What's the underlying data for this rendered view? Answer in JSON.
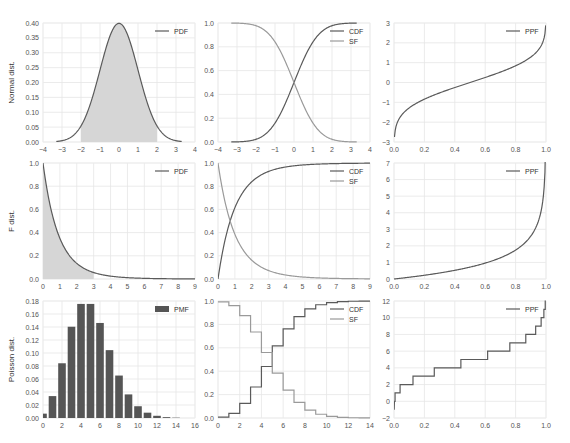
{
  "figure": {
    "row_labels": [
      "Normal dist.",
      "F dist.",
      "Poisson dist."
    ],
    "colors": {
      "dark_line": "#5a5a5a",
      "light_line": "#9a9a9a",
      "fill": "#d6d6d6",
      "bar": "#555555",
      "grid": "#e6e6e6"
    }
  },
  "chart_data": [
    {
      "id": "normal-pdf",
      "type": "area",
      "title": "",
      "ylabel": "Normal dist.",
      "xlim": [
        -4,
        4
      ],
      "ylim": [
        0,
        0.4
      ],
      "xticks": [
        "−4",
        "−3",
        "−2",
        "−1",
        "0",
        "1",
        "2",
        "3",
        "4"
      ],
      "yticks": [
        "0.00",
        "0.05",
        "0.10",
        "0.15",
        "0.20",
        "0.25",
        "0.30",
        "0.35",
        "0.40"
      ],
      "legend": [
        "PDF"
      ],
      "series": [
        {
          "name": "PDF",
          "function": "normal_pdf",
          "x_range": [
            -3.3,
            3.3
          ]
        }
      ],
      "shaded_region": [
        -2,
        2
      ],
      "grid": true,
      "legend_position": "upper right"
    },
    {
      "id": "normal-cdf-sf",
      "type": "line",
      "xlim": [
        -4,
        4
      ],
      "ylim": [
        0,
        1
      ],
      "xticks": [
        "−4",
        "−3",
        "−2",
        "−1",
        "0",
        "1",
        "2",
        "3",
        "4"
      ],
      "yticks": [
        "0.0",
        "0.2",
        "0.4",
        "0.6",
        "0.8",
        "1.0"
      ],
      "legend": [
        "CDF",
        "SF"
      ],
      "series": [
        {
          "name": "CDF",
          "function": "normal_cdf",
          "x_range": [
            -3.3,
            3.3
          ]
        },
        {
          "name": "SF",
          "function": "normal_sf",
          "x_range": [
            -3.3,
            3.3
          ]
        }
      ],
      "grid": true,
      "legend_position": "upper right"
    },
    {
      "id": "normal-ppf",
      "type": "line",
      "xlim": [
        0,
        1
      ],
      "ylim": [
        -3,
        3
      ],
      "xticks": [
        "0.0",
        "0.2",
        "0.4",
        "0.6",
        "0.8",
        "1.0"
      ],
      "yticks": [
        "−3",
        "−2",
        "−1",
        "0",
        "1",
        "2",
        "3"
      ],
      "legend": [
        "PPF"
      ],
      "series": [
        {
          "name": "PPF",
          "function": "normal_ppf",
          "x_range": [
            0.003,
            0.998
          ]
        }
      ],
      "grid": true,
      "legend_position": "upper right"
    },
    {
      "id": "f-pdf",
      "type": "area",
      "ylabel": "F dist.",
      "xlim": [
        0,
        9
      ],
      "ylim": [
        0,
        1
      ],
      "xticks": [
        "0",
        "1",
        "2",
        "3",
        "4",
        "5",
        "6",
        "7",
        "8",
        "9"
      ],
      "yticks": [
        "0.0",
        "0.2",
        "0.4",
        "0.6",
        "0.8",
        "1.0"
      ],
      "legend": [
        "PDF"
      ],
      "series": [
        {
          "name": "PDF",
          "function": "f_pdf_d1_2",
          "x_range": [
            0,
            9
          ]
        }
      ],
      "shaded_region": [
        0,
        3
      ],
      "grid": true,
      "legend_position": "upper right"
    },
    {
      "id": "f-cdf-sf",
      "type": "line",
      "xlim": [
        0,
        9
      ],
      "ylim": [
        0,
        1
      ],
      "xticks": [
        "0",
        "1",
        "2",
        "3",
        "4",
        "5",
        "6",
        "7",
        "8",
        "9"
      ],
      "yticks": [
        "0.0",
        "0.2",
        "0.4",
        "0.6",
        "0.8",
        "1.0"
      ],
      "legend": [
        "CDF",
        "SF"
      ],
      "series": [
        {
          "name": "CDF",
          "function": "f_cdf"
        },
        {
          "name": "SF",
          "function": "f_sf"
        }
      ],
      "grid": true,
      "legend_position": "upper right"
    },
    {
      "id": "f-ppf",
      "type": "line",
      "xlim": [
        0,
        1
      ],
      "ylim": [
        0,
        7
      ],
      "xticks": [
        "0.0",
        "0.2",
        "0.4",
        "0.6",
        "0.8",
        "1.0"
      ],
      "yticks": [
        "0",
        "1",
        "2",
        "3",
        "4",
        "5",
        "6",
        "7"
      ],
      "legend": [
        "PPF"
      ],
      "series": [
        {
          "name": "PPF",
          "function": "f_ppf",
          "x_range": [
            0,
            0.998
          ]
        }
      ],
      "grid": true,
      "legend_position": "upper right"
    },
    {
      "id": "poisson-pmf",
      "type": "bar",
      "ylabel": "Poisson dist.",
      "xlim": [
        0,
        16
      ],
      "ylim": [
        0,
        0.18
      ],
      "xticks": [
        "0",
        "2",
        "4",
        "6",
        "8",
        "10",
        "12",
        "14",
        "16"
      ],
      "yticks": [
        "0.00",
        "0.02",
        "0.04",
        "0.06",
        "0.08",
        "0.10",
        "0.12",
        "0.14",
        "0.16",
        "0.18"
      ],
      "legend": [
        "PMF"
      ],
      "categories": [
        0,
        1,
        2,
        3,
        4,
        5,
        6,
        7,
        8,
        9,
        10,
        11,
        12,
        13,
        14
      ],
      "values": [
        0.0067,
        0.0337,
        0.0842,
        0.1404,
        0.1755,
        0.1755,
        0.1462,
        0.1044,
        0.0653,
        0.0363,
        0.0181,
        0.0082,
        0.0034,
        0.0013,
        0.0005
      ],
      "grid": true,
      "legend_position": "upper right"
    },
    {
      "id": "poisson-cdf-sf",
      "type": "line",
      "step": true,
      "xlim": [
        0,
        14
      ],
      "ylim": [
        0,
        1
      ],
      "xticks": [
        "0",
        "2",
        "4",
        "6",
        "8",
        "10",
        "12",
        "14"
      ],
      "yticks": [
        "0.0",
        "0.2",
        "0.4",
        "0.6",
        "0.8",
        "1.0"
      ],
      "legend": [
        "CDF",
        "SF"
      ],
      "series": [
        {
          "name": "CDF",
          "x": [
            0,
            1,
            2,
            3,
            4,
            5,
            6,
            7,
            8,
            9,
            10,
            11,
            12,
            13
          ],
          "values": [
            0.007,
            0.04,
            0.125,
            0.265,
            0.44,
            0.616,
            0.762,
            0.867,
            0.932,
            0.968,
            0.986,
            0.995,
            0.998,
            0.999
          ]
        },
        {
          "name": "SF",
          "x": [
            0,
            1,
            2,
            3,
            4,
            5,
            6,
            7,
            8,
            9,
            10,
            11,
            12,
            13
          ],
          "values": [
            0.993,
            0.96,
            0.875,
            0.735,
            0.56,
            0.384,
            0.238,
            0.133,
            0.068,
            0.032,
            0.014,
            0.005,
            0.002,
            0.001
          ]
        }
      ],
      "grid": true,
      "legend_position": "upper right"
    },
    {
      "id": "poisson-ppf",
      "type": "line",
      "step": true,
      "xlim": [
        0,
        1
      ],
      "ylim": [
        -2,
        12
      ],
      "xticks": [
        "0.0",
        "0.2",
        "0.4",
        "0.6",
        "0.8",
        "1.0"
      ],
      "yticks": [
        "−2",
        "0",
        "2",
        "4",
        "6",
        "8",
        "10",
        "12"
      ],
      "legend": [
        "PPF"
      ],
      "series": [
        {
          "name": "PPF",
          "levels": [
            0,
            1,
            2,
            3,
            4,
            5,
            6,
            7,
            8,
            9,
            10,
            11,
            12
          ],
          "cdf_breaks": [
            0.007,
            0.04,
            0.125,
            0.265,
            0.44,
            0.616,
            0.762,
            0.867,
            0.932,
            0.968,
            0.986,
            0.995,
            0.998
          ]
        }
      ],
      "grid": true,
      "legend_position": "upper right"
    }
  ]
}
